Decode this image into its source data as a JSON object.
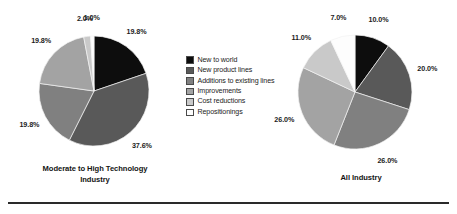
{
  "legend": {
    "items": [
      {
        "label": "New to world",
        "color": "#0d0d0d"
      },
      {
        "label": "New product lines",
        "color": "#595959"
      },
      {
        "label": "Additions to existing lines",
        "color": "#808080"
      },
      {
        "label": "Improvements",
        "color": "#a3a3a3"
      },
      {
        "label": "Cost reductions",
        "color": "#c9c9c9"
      },
      {
        "label": "Repositionings",
        "color": "#fdfdfd"
      }
    ]
  },
  "chart_data": [
    {
      "type": "pie",
      "title": "Moderate to High Technology Industry",
      "title_lines": [
        "Moderate to High Technology",
        "Industry"
      ],
      "categories": [
        "New to world",
        "New product lines",
        "Additions to existing lines",
        "Improvements",
        "Cost reductions",
        "Repositionings"
      ],
      "values": [
        19.8,
        37.6,
        19.8,
        19.8,
        2.0,
        1.0
      ],
      "labels": [
        "19.8%",
        "37.6%",
        "19.8%",
        "19.8%",
        "2.0%",
        "1.0%"
      ],
      "colors": [
        "#0d0d0d",
        "#595959",
        "#808080",
        "#a3a3a3",
        "#c9c9c9",
        "#fdfdfd"
      ],
      "unit": "%",
      "start_angle_deg": 0,
      "direction": "clockwise",
      "legend_position": "center-between-charts",
      "grid": false
    },
    {
      "type": "pie",
      "title": "All Industry",
      "title_lines": [
        "All Industry"
      ],
      "categories": [
        "New to world",
        "New product lines",
        "Additions to existing lines",
        "Improvements",
        "Cost reductions",
        "Repositionings"
      ],
      "values": [
        10.0,
        20.0,
        26.0,
        26.0,
        11.0,
        7.0
      ],
      "labels": [
        "10.0%",
        "20.0%",
        "26.0%",
        "26.0%",
        "11.0%",
        "7.0%"
      ],
      "colors": [
        "#0d0d0d",
        "#595959",
        "#808080",
        "#a3a3a3",
        "#c9c9c9",
        "#fdfdfd"
      ],
      "unit": "%",
      "start_angle_deg": 0,
      "direction": "clockwise",
      "legend_position": "center-between-charts",
      "grid": false
    }
  ]
}
